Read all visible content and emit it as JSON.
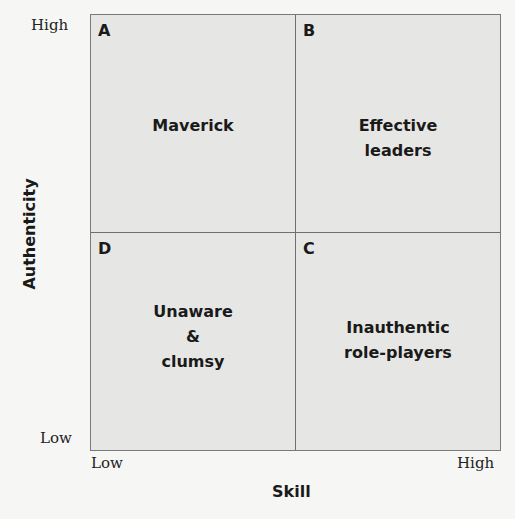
{
  "diagram": {
    "type": "2x2 matrix",
    "x_axis": {
      "title": "Skill",
      "low_label": "Low",
      "high_label": "High"
    },
    "y_axis": {
      "title": "Authenticity",
      "low_label": "Low",
      "high_label": "High"
    },
    "quadrants": [
      {
        "id": "A",
        "position": "top-left",
        "label": "Maverick"
      },
      {
        "id": "B",
        "position": "top-right",
        "label": "Effective\nleaders"
      },
      {
        "id": "D",
        "position": "bottom-left",
        "label": "Unaware\n&\nclumsy"
      },
      {
        "id": "C",
        "position": "bottom-right",
        "label": "Inauthentic\nrole-players"
      }
    ]
  },
  "colors": {
    "background": "#f6f6f4",
    "quadrant_fill": "#e6e6e4",
    "grid_lines": "#6f6f6f",
    "text": "#1a1a1a"
  }
}
